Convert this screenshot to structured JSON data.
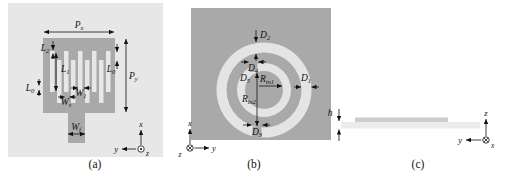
{
  "panels": {
    "a": {
      "caption": "(a)",
      "axis": {
        "up": "x",
        "left": "y",
        "out_of_plane": "z"
      },
      "labels": {
        "Px": {
          "base": "P",
          "sub": "x"
        },
        "Py": {
          "base": "P",
          "sub": "y"
        },
        "L2": {
          "base": "L",
          "sub": "2"
        },
        "L1": {
          "base": "L",
          "sub": "1"
        },
        "L0_right": {
          "base": "L",
          "sub": "0"
        },
        "L0_left": {
          "base": "L",
          "sub": "0"
        },
        "W1": {
          "base": "W",
          "sub": "1"
        },
        "Ws": {
          "base": "W",
          "sub": "s"
        },
        "Wf": {
          "base": "W",
          "sub": "f"
        }
      }
    },
    "b": {
      "caption": "(b)",
      "axis": {
        "up": "x",
        "right": "y",
        "into_plane": "z"
      },
      "labels": {
        "D1": {
          "base": "D",
          "sub": "1"
        },
        "D2": {
          "base": "D",
          "sub": "2"
        },
        "D3": {
          "base": "D",
          "sub": "3"
        },
        "D4": {
          "base": "D",
          "sub": "4"
        },
        "D5": {
          "base": "D",
          "sub": "5"
        },
        "Rin1": {
          "base": "R",
          "sub": "in1"
        },
        "Rin2": {
          "base": "R",
          "sub": "in2"
        }
      }
    },
    "c": {
      "caption": "(c)",
      "axis": {
        "up": "z",
        "left": "y",
        "into_plane": "x"
      },
      "labels": {
        "h": {
          "base": "h"
        }
      }
    }
  },
  "colors": {
    "panel_bg": "#e7e7e7",
    "metal_gray": "#a9a9a9",
    "ring_slot": "#e4e4e4",
    "substrate": "#ececec",
    "patch_strip": "#cccccc",
    "annotation": "#111111"
  }
}
